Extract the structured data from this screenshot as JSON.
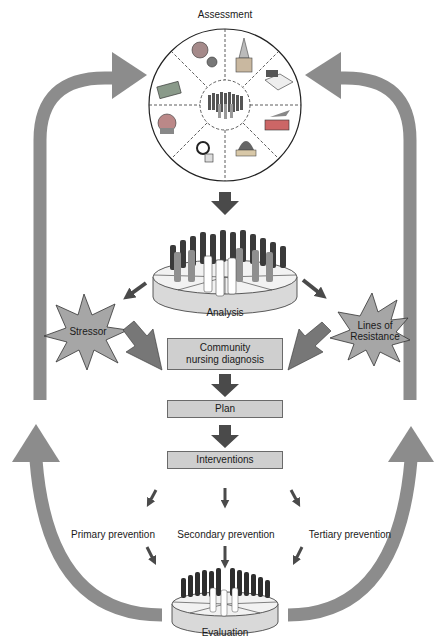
{
  "diagram": {
    "title": "Assessment",
    "assessment_wheel": {
      "center_icon": "community-people-icon",
      "segments": [
        {
          "icon": "recreation-sports-icon"
        },
        {
          "icon": "church-religion-icon"
        },
        {
          "icon": "education-book-icon"
        },
        {
          "icon": "transportation-bus-plane-icon"
        },
        {
          "icon": "politics-government-icon"
        },
        {
          "icon": "health-social-services-icon"
        },
        {
          "icon": "communication-telephone-icon"
        },
        {
          "icon": "economics-money-icon"
        }
      ]
    },
    "nodes": {
      "analysis": "Analysis",
      "stressor": "Stressor",
      "lines_of_resistance_1": "Lines of",
      "lines_of_resistance_2": "Resistance",
      "diagnosis_1": "Community",
      "diagnosis_2": "nursing diagnosis",
      "plan": "Plan",
      "interventions": "Interventions",
      "primary": "Primary prevention",
      "secondary": "Secondary prevention",
      "tertiary": "Tertiary prevention",
      "evaluation": "Evaluation"
    },
    "colors": {
      "loop_arrow": "#8c8c8c",
      "flow_arrow": "#4a4a4a",
      "star_fill": "#a6a6a6",
      "box_fill": "#cfcfcf",
      "disc_side": "#d9d9d9"
    }
  }
}
